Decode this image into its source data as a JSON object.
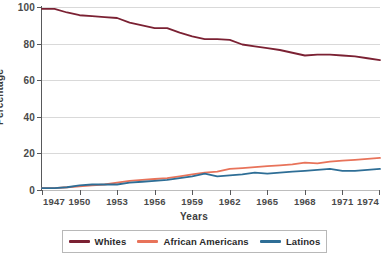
{
  "chart_data": {
    "type": "line",
    "title": "",
    "xlabel": "Years",
    "ylabel": "Percentage",
    "xlim": [
      1947,
      1974
    ],
    "ylim": [
      0,
      100
    ],
    "grid": true,
    "legend_position": "bottom",
    "x": [
      1947,
      1948,
      1949,
      1950,
      1951,
      1952,
      1953,
      1954,
      1955,
      1956,
      1957,
      1958,
      1959,
      1960,
      1961,
      1962,
      1963,
      1964,
      1965,
      1966,
      1967,
      1968,
      1969,
      1970,
      1971,
      1972,
      1973,
      1974
    ],
    "xticks": [
      "1947",
      "1950",
      "1953",
      "1956",
      "1959",
      "1962",
      "1965",
      "1968",
      "1971",
      "1974"
    ],
    "yticks": [
      "0",
      "20",
      "40",
      "60",
      "80",
      "100"
    ],
    "series": [
      {
        "name": "Whites",
        "color": "#7b2133",
        "values": [
          99,
          99,
          97,
          95.5,
          95,
          94.5,
          94,
          91.5,
          90,
          88.5,
          88.5,
          86,
          84,
          82.5,
          82.5,
          82,
          79.5,
          78.5,
          77.5,
          76.5,
          75,
          73.5,
          74,
          74,
          73.5,
          73,
          72,
          71
        ]
      },
      {
        "name": "African Americans",
        "color": "#e8735a",
        "values": [
          1,
          1,
          1.5,
          2,
          2.5,
          3,
          4,
          5,
          5.5,
          6,
          6.5,
          7.5,
          8.5,
          9.5,
          10,
          11.5,
          12,
          12.5,
          13,
          13.5,
          14,
          15,
          14.5,
          15.5,
          16,
          16.5,
          17,
          17.5
        ]
      },
      {
        "name": "Latinos",
        "color": "#2e6e96",
        "values": [
          1,
          1,
          1.5,
          2.5,
          3,
          3,
          3,
          4,
          4.5,
          5,
          5.5,
          6.5,
          7.5,
          9,
          7.5,
          8,
          8.5,
          9.5,
          9,
          9.5,
          10,
          10.5,
          11,
          11.5,
          10.5,
          10.5,
          11,
          11.5
        ]
      }
    ]
  },
  "legend": {
    "items": [
      {
        "label": "Whites",
        "color": "#7b2133"
      },
      {
        "label": "African Americans",
        "color": "#e8735a"
      },
      {
        "label": "Latinos",
        "color": "#2e6e96"
      }
    ]
  }
}
